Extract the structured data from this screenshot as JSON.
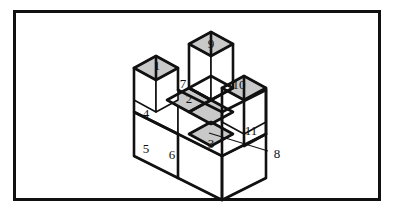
{
  "figure": {
    "frame": {
      "border_color": "#111111",
      "background_color": "#ffffff"
    },
    "palette": {
      "line": "#111111",
      "face_white": "#ffffff",
      "face_shaded": "#c9c9c9"
    },
    "projection": {
      "type": "isometric",
      "cube_edge_px": 44,
      "dx": 22,
      "dy": 12,
      "dz": 31
    },
    "labels": [
      {
        "id": "label-1",
        "text": "1",
        "face": "top",
        "shaded": true,
        "x": 157,
        "y": 67
      },
      {
        "id": "label-2",
        "text": "2",
        "face": "top",
        "shaded": true,
        "x": 189,
        "y": 100
      },
      {
        "id": "label-3",
        "text": "3",
        "face": "top",
        "shaded": true,
        "x": 211,
        "y": 145
      },
      {
        "id": "label-4",
        "text": "4",
        "face": "left",
        "shaded": false,
        "x": 145,
        "y": 115
      },
      {
        "id": "label-5",
        "text": "5",
        "face": "left",
        "shaded": false,
        "x": 145,
        "y": 150
      },
      {
        "id": "label-6",
        "text": "6",
        "face": "left",
        "shaded": false,
        "x": 170,
        "y": 155
      },
      {
        "id": "label-7",
        "text": "7",
        "face": "top",
        "shaded": true,
        "x": 183,
        "y": 85
      },
      {
        "id": "label-9",
        "text": "9",
        "face": "top",
        "shaded": true,
        "x": 211,
        "y": 45
      },
      {
        "id": "label-10",
        "text": "10",
        "face": "top",
        "shaded": true,
        "x": 238,
        "y": 86
      },
      {
        "id": "label-11",
        "text": "11",
        "face": "right",
        "shaded": false,
        "x": 250,
        "y": 132
      }
    ],
    "callouts": [
      {
        "id": "callout-8",
        "text": "8",
        "label_x": 277,
        "label_y": 154,
        "leader_from_x": 209,
        "leader_from_y": 133,
        "leader_to_x": 268,
        "leader_to_y": 151
      }
    ],
    "label_values": {
      "one": "1",
      "two": "2",
      "three": "3",
      "four": "4",
      "five": "5",
      "six": "6",
      "seven": "7",
      "eight": "8",
      "nine": "9",
      "ten": "10",
      "eleven": "11"
    }
  }
}
